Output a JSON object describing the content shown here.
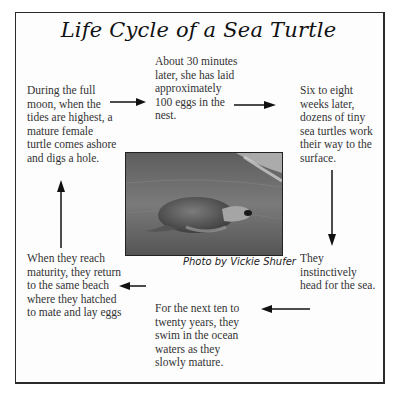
{
  "title": "Life Cycle of a Sea Turtle",
  "stages": [
    {
      "id": "nesting",
      "text": "During the full moon, when the tides are highest, a mature female turtle comes ashore and digs a hole."
    },
    {
      "id": "laying",
      "text": "About 30  minutes later, she has laid approximately 100 eggs in the nest."
    },
    {
      "id": "hatching",
      "text": "Six to eight weeks later, dozens of tiny sea turtles work their way to the surface."
    },
    {
      "id": "to-sea",
      "text": "They instinctively head for the sea."
    },
    {
      "id": "ocean-years",
      "text": "For the next ten to twenty years, they swim in the ocean waters as they slowly mature."
    },
    {
      "id": "return",
      "text": "When they reach maturity, they return to the same beach where they hatched to mate and lay eggs"
    }
  ],
  "photo": {
    "subject": "sea turtle on beach",
    "caption": "Photo by Vickie Shufer"
  },
  "colors": {
    "border": "#2a2a2a",
    "text": "#333333",
    "title": "#111111"
  }
}
